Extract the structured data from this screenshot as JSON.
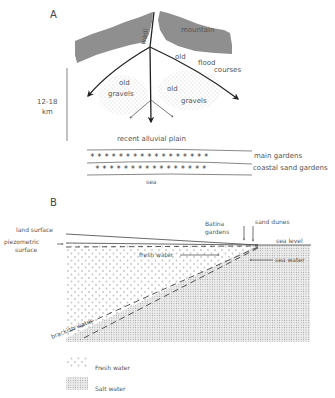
{
  "panel_a": {
    "letter": "A",
    "labels": {
      "wadi": "wadi",
      "mountain": "mountain",
      "old": "old",
      "flood": "flood",
      "courses": "courses",
      "gravels_left_1": "old",
      "gravels_left_2": "gravels",
      "gravels_right_1": "old",
      "gravels_right_2": "gravels",
      "scale_1": "12-18",
      "scale_2": "km",
      "recent_plain": "recent alluvial plain",
      "main_gardens": "main gardens",
      "coastal_gardens": "coastal sand gardens",
      "sea": "sea"
    },
    "colors": {
      "mountain": "#8f8f8f",
      "line": "#222222",
      "dots": "#9a9a9a"
    }
  },
  "panel_b": {
    "letter": "B",
    "labels": {
      "land_surface": "land surface",
      "piezo_1": "piezometric",
      "piezo_2": "surface",
      "batina_1": "Batina",
      "batina_2": "gardens",
      "sand_dunes": "sand dunes",
      "sea_level": "sea level",
      "fresh_water": "fresh water",
      "sea_water": "sea water",
      "brackish": "brackish water"
    }
  },
  "legend": {
    "items": [
      {
        "label": "Fresh water",
        "pattern": "fresh"
      },
      {
        "label": "Salt water",
        "pattern": "salt"
      }
    ]
  }
}
